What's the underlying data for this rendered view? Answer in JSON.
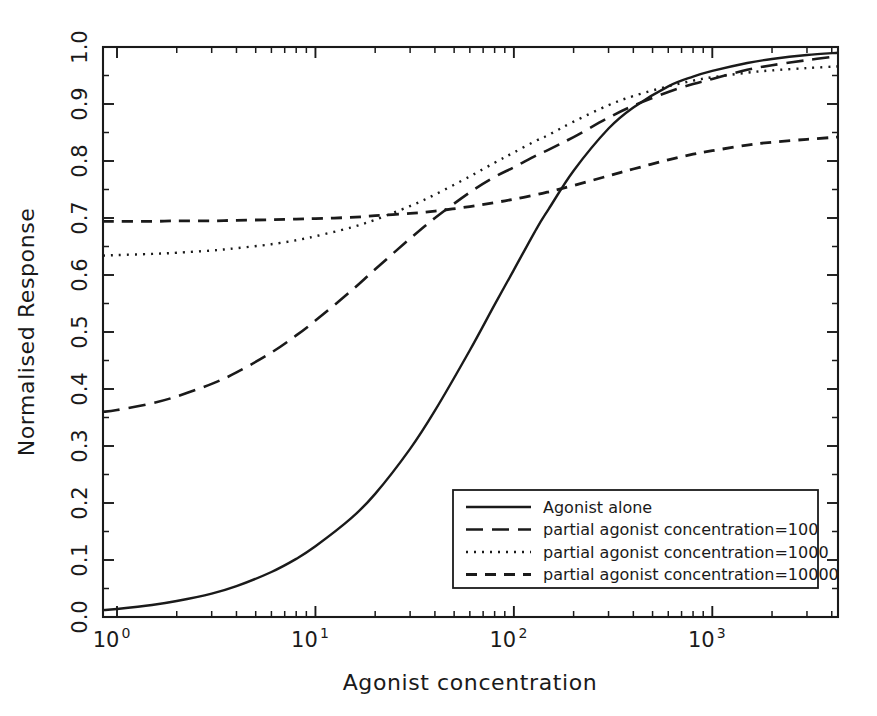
{
  "chart_data": {
    "type": "line",
    "title": "",
    "xlabel": "Agonist concentration",
    "ylabel": "Normalised Response",
    "xscale": "log",
    "yscale": "linear",
    "xlim": [
      0.85,
      4300
    ],
    "ylim": [
      0.0,
      1.0
    ],
    "grid": false,
    "legend_position": "lower right",
    "x_tick_labels": [
      "10^0",
      "10^1",
      "10^2",
      "10^3"
    ],
    "x_tick_values": [
      1,
      10,
      100,
      1000
    ],
    "y_tick_labels": [
      "0.0",
      "0.1",
      "0.2",
      "0.3",
      "0.4",
      "0.5",
      "0.6",
      "0.7",
      "0.8",
      "0.9",
      "1.0"
    ],
    "y_tick_values": [
      0.0,
      0.1,
      0.2,
      0.3,
      0.4,
      0.5,
      0.6,
      0.7,
      0.8,
      0.9,
      1.0
    ],
    "x": [
      0.85,
      1,
      1.5,
      2,
      3,
      4,
      6,
      8,
      10,
      15,
      20,
      30,
      40,
      60,
      80,
      100,
      130,
      150,
      200,
      300,
      400,
      600,
      800,
      1000,
      1500,
      2000,
      3000,
      4300
    ],
    "series": [
      {
        "name": "Agonist alone",
        "style": "solid",
        "color": "#1a1a1a",
        "values": [
          0.012,
          0.014,
          0.021,
          0.028,
          0.041,
          0.054,
          0.079,
          0.102,
          0.124,
          0.172,
          0.216,
          0.295,
          0.362,
          0.468,
          0.548,
          0.609,
          0.681,
          0.716,
          0.783,
          0.857,
          0.894,
          0.931,
          0.948,
          0.958,
          0.972,
          0.979,
          0.986,
          0.99
        ]
      },
      {
        "name": "partial agonist concentration=100",
        "style": "longdash",
        "color": "#1a1a1a",
        "values": [
          0.36,
          0.363,
          0.375,
          0.387,
          0.409,
          0.429,
          0.464,
          0.494,
          0.52,
          0.571,
          0.61,
          0.664,
          0.7,
          0.745,
          0.772,
          0.789,
          0.81,
          0.82,
          0.842,
          0.876,
          0.897,
          0.921,
          0.935,
          0.944,
          0.96,
          0.968,
          0.977,
          0.984
        ]
      },
      {
        "name": "partial agonist concentration=1000",
        "style": "dotted",
        "color": "#1a1a1a",
        "values": [
          0.634,
          0.635,
          0.637,
          0.639,
          0.643,
          0.647,
          0.654,
          0.661,
          0.668,
          0.683,
          0.697,
          0.721,
          0.741,
          0.773,
          0.797,
          0.815,
          0.836,
          0.846,
          0.869,
          0.898,
          0.914,
          0.931,
          0.941,
          0.947,
          0.955,
          0.959,
          0.963,
          0.966
        ]
      },
      {
        "name": "partial agonist concentration=10000",
        "style": "dashed",
        "color": "#1a1a1a",
        "values": [
          0.694,
          0.694,
          0.694,
          0.695,
          0.695,
          0.696,
          0.697,
          0.698,
          0.699,
          0.701,
          0.704,
          0.708,
          0.712,
          0.72,
          0.727,
          0.733,
          0.741,
          0.746,
          0.757,
          0.774,
          0.786,
          0.802,
          0.812,
          0.818,
          0.828,
          0.833,
          0.838,
          0.842
        ]
      }
    ],
    "annotations": []
  },
  "legend": {
    "entries": [
      {
        "label": "Agonist alone",
        "style": "solid"
      },
      {
        "label": "partial agonist concentration=100",
        "style": "longdash"
      },
      {
        "label": "partial agonist concentration=1000",
        "style": "dotted"
      },
      {
        "label": "partial agonist concentration=10000",
        "style": "dashed"
      }
    ]
  }
}
